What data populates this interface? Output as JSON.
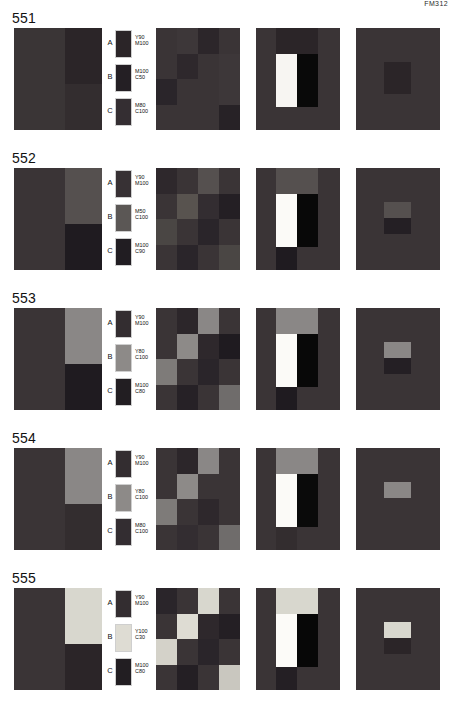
{
  "header": {
    "text": "FM312"
  },
  "groups": [
    {
      "number": "551",
      "quad": {
        "top_left": "#3a3536",
        "top_right": "#2b2528",
        "bottom_left": "#3a3536",
        "bottom_right": "#332d2f"
      },
      "legend": [
        {
          "letter": "A",
          "swatch": "#2b2528",
          "line1": "Y90",
          "line2": "M100"
        },
        {
          "letter": "B",
          "swatch": "#241f24",
          "line1": "M100",
          "line2": "C50"
        },
        {
          "letter": "C",
          "swatch": "#342e32",
          "line1": "M80",
          "line2": "C100"
        }
      ],
      "mosaic": [
        "#3a3436",
        "#3d3739",
        "#2c262a",
        "#3a3436",
        "#3a3436",
        "#2e282c",
        "#3a3436",
        "#3d3739",
        "#2a252a",
        "#3a3436",
        "#3a3436",
        "#3d3739",
        "#3a3436",
        "#3a3436",
        "#3a3436",
        "#272226"
      ],
      "bars": {
        "background": "#3a3436",
        "top": "#2b2528",
        "white": "#f7f5f2",
        "black": "#090909",
        "bottom": "#3a3436"
      },
      "spot": {
        "background": "#3a3436",
        "upper": "#2b2528",
        "lower": "#2b2528"
      }
    },
    {
      "number": "552",
      "quad": {
        "top_left": "#3a3436",
        "top_right": "#55504f",
        "bottom_left": "#3a3436",
        "bottom_right": "#1f1b20"
      },
      "legend": [
        {
          "letter": "A",
          "swatch": "#373134",
          "line1": "Y90",
          "line2": "M100"
        },
        {
          "letter": "B",
          "swatch": "#5b5755",
          "line1": "M50",
          "line2": "C100"
        },
        {
          "letter": "C",
          "swatch": "#211d22",
          "line1": "M100",
          "line2": "C90"
        }
      ],
      "mosaic": [
        "#2e282c",
        "#3a3436",
        "#55504f",
        "#3a3436",
        "#3a3436",
        "#58534f",
        "#332d31",
        "#241f24",
        "#4a4644",
        "#3a3436",
        "#2a252a",
        "#3a3436",
        "#3a3436",
        "#2a252a",
        "#3a3436",
        "#4a4644"
      ],
      "bars": {
        "background": "#3a3436",
        "top": "#55504f",
        "white": "#fbfaf7",
        "black": "#080808",
        "bottom": "#1f1b20"
      },
      "spot": {
        "background": "#3a3436",
        "upper": "#55504f",
        "lower": "#241f24"
      }
    },
    {
      "number": "553",
      "quad": {
        "top_left": "#3a3436",
        "top_right": "#8a8786",
        "bottom_left": "#3a3436",
        "bottom_right": "#1f1b20"
      },
      "legend": [
        {
          "letter": "A",
          "swatch": "#332d30",
          "line1": "Y90",
          "line2": "M100"
        },
        {
          "letter": "B",
          "swatch": "#8d8a88",
          "line1": "Y80",
          "line2": "C100"
        },
        {
          "letter": "C",
          "swatch": "#221e22",
          "line1": "M100",
          "line2": "C80"
        }
      ],
      "mosaic": [
        "#3a3436",
        "#2c262a",
        "#8a8786",
        "#3a3436",
        "#3a3436",
        "#8d8a88",
        "#2e282c",
        "#1f1b20",
        "#7e7b79",
        "#3a3436",
        "#2a252a",
        "#3a3436",
        "#3a3436",
        "#262126",
        "#3a3436",
        "#6f6c6b"
      ],
      "bars": {
        "background": "#3a3436",
        "top": "#8a8786",
        "white": "#fbfaf7",
        "black": "#080808",
        "bottom": "#1f1b20"
      },
      "spot": {
        "background": "#3a3436",
        "upper": "#8a8786",
        "lower": "#241f24"
      }
    },
    {
      "number": "554",
      "quad": {
        "top_left": "#3a3436",
        "top_right": "#8a8786",
        "bottom_left": "#3a3436",
        "bottom_right": "#332d2f"
      },
      "legend": [
        {
          "letter": "A",
          "swatch": "#332d30",
          "line1": "Y90",
          "line2": "M100"
        },
        {
          "letter": "B",
          "swatch": "#8d8a88",
          "line1": "Y80",
          "line2": "C100"
        },
        {
          "letter": "C",
          "swatch": "#332d31",
          "line1": "M80",
          "line2": "C100"
        }
      ],
      "mosaic": [
        "#3a3436",
        "#2c262a",
        "#8a8786",
        "#3a3436",
        "#3a3436",
        "#8d8a88",
        "#3a3436",
        "#3a3436",
        "#7e7b79",
        "#3a3436",
        "#2e282c",
        "#3a3436",
        "#3a3436",
        "#332d31",
        "#3a3436",
        "#6f6c6b"
      ],
      "bars": {
        "background": "#3a3436",
        "top": "#8a8786",
        "white": "#fbfaf7",
        "black": "#0a0a0a",
        "bottom": "#332d2f"
      },
      "spot": {
        "background": "#3a3436",
        "upper": "#8a8786",
        "lower": "#3a3436"
      }
    },
    {
      "number": "555",
      "quad": {
        "top_left": "#3a3436",
        "top_right": "#d8d7ce",
        "bottom_left": "#3a3436",
        "bottom_right": "#2b2528"
      },
      "legend": [
        {
          "letter": "A",
          "swatch": "#332d30",
          "line1": "Y90",
          "line2": "M100"
        },
        {
          "letter": "B",
          "swatch": "#dedcd3",
          "line1": "Y100",
          "line2": "C30"
        },
        {
          "letter": "C",
          "swatch": "#221e22",
          "line1": "M100",
          "line2": "C80"
        }
      ],
      "mosaic": [
        "#2a252a",
        "#3a3436",
        "#d8d7ce",
        "#3a3436",
        "#3a3436",
        "#dedcd3",
        "#2e282c",
        "#241f24",
        "#d4d2c9",
        "#3a3436",
        "#2a252a",
        "#3a3436",
        "#3a3436",
        "#241f24",
        "#3a3436",
        "#c9c7bf"
      ],
      "bars": {
        "background": "#3a3436",
        "top": "#d8d7ce",
        "white": "#fcfbf8",
        "black": "#070707",
        "bottom": "#241f24"
      },
      "spot": {
        "background": "#3a3436",
        "upper": "#d8d7ce",
        "lower": "#2b2528"
      }
    }
  ]
}
